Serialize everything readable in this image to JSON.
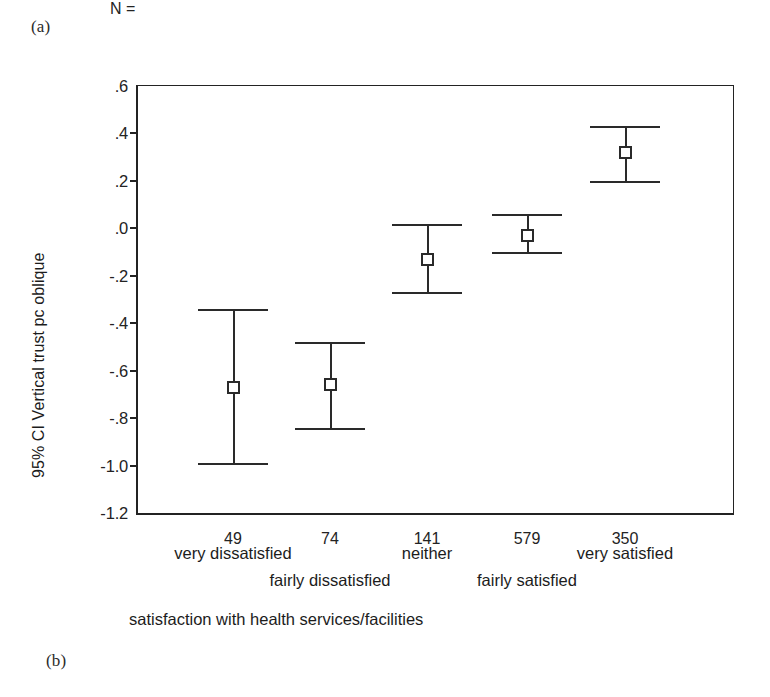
{
  "panels": {
    "a_label": "(a)",
    "b_label": "(b)"
  },
  "chart_data": {
    "type": "scatter",
    "title": "",
    "subtitle": "",
    "xlabel": "satisfaction with health services/facilities",
    "ylabel": "95% CI Vertical trust  pc oblique",
    "grid": false,
    "legend": null,
    "ylim": [
      -1.2,
      0.6
    ],
    "ytick_labels": [
      ".6",
      ".4",
      ".2",
      ".0",
      "-.2",
      "-.4",
      "-.6",
      "-.8",
      "-1.0",
      "-1.2"
    ],
    "ytick_values": [
      0.6,
      0.4,
      0.2,
      0.0,
      -0.2,
      -0.4,
      -0.6,
      -0.8,
      -1.0,
      -1.2
    ],
    "categories": [
      "very dissatisfied",
      "fairly dissatisfied",
      "neither",
      "fairly satisfied",
      "very satisfied"
    ],
    "n_label": "N =",
    "n_values": [
      "49",
      "74",
      "141",
      "579",
      "350"
    ],
    "error_bar_type": "95% CI",
    "marker_style": "open-square",
    "series": [
      {
        "name": "95% CI Vertical trust pc oblique",
        "values": [
          -0.67,
          -0.66,
          -0.13,
          -0.03,
          0.32
        ],
        "ci_lower": [
          -0.99,
          -0.84,
          -0.27,
          -0.1,
          0.2
        ],
        "ci_upper": [
          -0.34,
          -0.48,
          0.02,
          0.06,
          0.43
        ]
      }
    ],
    "points": [
      {
        "category": "very dissatisfied",
        "n": "49",
        "mean": -0.67,
        "lower": -0.99,
        "upper": -0.34
      },
      {
        "category": "fairly dissatisfied",
        "n": "74",
        "mean": -0.66,
        "lower": -0.84,
        "upper": -0.48
      },
      {
        "category": "neither",
        "n": "141",
        "mean": -0.13,
        "lower": -0.27,
        "upper": 0.02
      },
      {
        "category": "fairly satisfied",
        "n": "579",
        "mean": -0.03,
        "lower": -0.1,
        "upper": 0.06
      },
      {
        "category": "very satisfied",
        "n": "350",
        "mean": 0.32,
        "lower": 0.2,
        "upper": 0.43
      }
    ],
    "colors": {
      "axis": "#232323",
      "marker_edge": "#2a2a2a",
      "marker_fill": "#ffffff",
      "background": "#ffffff"
    }
  }
}
